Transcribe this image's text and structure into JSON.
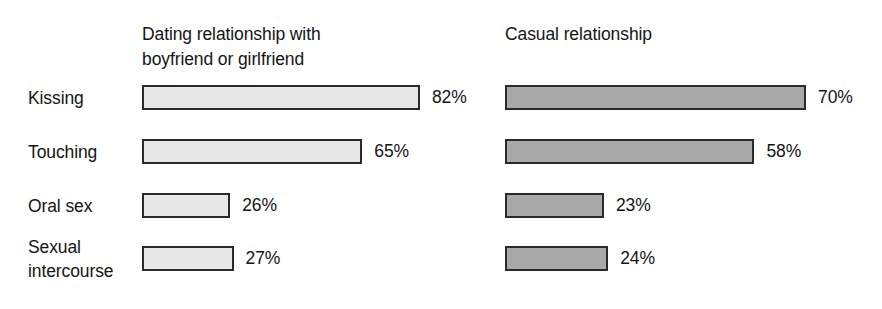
{
  "chart_data": {
    "type": "bar",
    "orientation": "horizontal",
    "title": "",
    "subtitle": "",
    "xlabel": "",
    "ylabel": "",
    "grid": false,
    "legend_position": "top-inline-column-headers",
    "value_suffix": "%",
    "xlim": [
      0,
      100
    ],
    "categories": [
      "Kissing",
      "Touching",
      "Oral sex",
      "Sexual\nintercourse"
    ],
    "series": [
      {
        "name": "Dating relationship with\nboyfriend or girlfriend",
        "color": "#e7e7e7",
        "values": [
          82,
          65,
          26,
          27
        ],
        "labels": [
          "82%",
          "65%",
          "26%",
          "27%"
        ]
      },
      {
        "name": "Casual relationship",
        "color": "#a9a9a9",
        "values": [
          70,
          58,
          23,
          24
        ],
        "labels": [
          "70%",
          "58%",
          "23%",
          "24%"
        ]
      }
    ]
  },
  "layout": {
    "row_tops": [
      85,
      139,
      193,
      246
    ],
    "left_group_x": 142,
    "right_group_x": 505,
    "left_px_per_percent": 3.39,
    "right_px_per_percent": 4.3,
    "bar_height": 25,
    "label_gap": 12
  },
  "colors": {
    "background": "#ffffff",
    "text": "#141414",
    "bar_border": "#2a2a2a",
    "series_one_fill": "#e7e7e7",
    "series_two_fill": "#a9a9a9"
  }
}
